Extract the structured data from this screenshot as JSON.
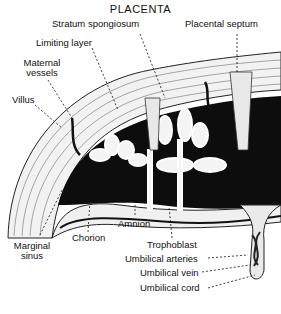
{
  "title": "PLACENTA",
  "labels": {
    "stratum_spongiosum": "Stratum spongiosum",
    "placental_septum": "Placental septum",
    "limiting_layer": "Limiting layer",
    "maternal_vessels_1": "Maternal",
    "maternal_vessels_2": "vessels",
    "villus": "Villus",
    "marginal_sinus_1": "Marginal",
    "marginal_sinus_2": "sinus",
    "chorion": "Chorion",
    "amnion": "Amnion",
    "trophoblast": "Trophoblast",
    "umbilical_arteries": "Umbilical arteries",
    "umbilical_vein": "Umbilical vein",
    "umbilical_cord": "Umbilical cord"
  },
  "colors": {
    "ink": "#111111",
    "background": "#ffffff",
    "tissue": "#e8e8e8"
  }
}
